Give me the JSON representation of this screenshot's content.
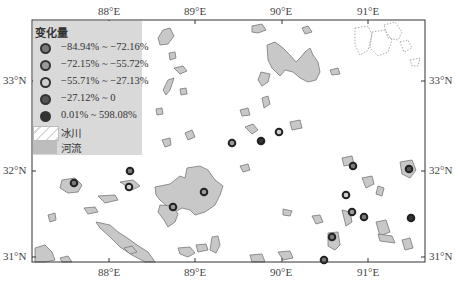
{
  "map": {
    "axes": {
      "top_labels": [
        "88°E",
        "89°E",
        "90°E",
        "91°E"
      ],
      "bottom_labels": [
        "88°E",
        "89°E",
        "90°E",
        "91°E"
      ],
      "left_labels": [
        "33°N",
        "32°N",
        "31°N"
      ],
      "right_labels": [
        "33°N",
        "32°N",
        "31°N"
      ]
    },
    "legend": {
      "title": "变化量",
      "classes": [
        {
          "label": "−84.94% ~ −72.16%",
          "fill": "#7a7a7a"
        },
        {
          "label": "−72.15% ~ −55.72%",
          "fill": "#9a9a9a"
        },
        {
          "label": "−55.71% ~ −27.13%",
          "fill": "#d0d0d0"
        },
        {
          "label": "−27.12% ~ 0",
          "fill": "#555555"
        },
        {
          "label": "0.01% ~ 598.08%",
          "fill": "#333333"
        }
      ],
      "glacier_label": "冰川",
      "river_label": "河流"
    },
    "colors": {
      "water": "#c8c8c8",
      "outline": "#666666",
      "legend_bg": "#d9d9d9",
      "frame": "#333333"
    }
  }
}
